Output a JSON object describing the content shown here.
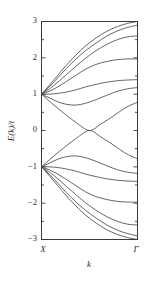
{
  "chart_data": {
    "type": "line",
    "title": "",
    "xlabel": "k",
    "ylabel": "E(k)/t",
    "xlim": [
      0,
      1
    ],
    "ylim": [
      -3,
      3
    ],
    "grid": false,
    "legend": null,
    "x_tick_labels": [
      "X",
      "Γ"
    ],
    "x_tick_positions": [
      0,
      1
    ],
    "y_tick_labels": [
      "3",
      "2",
      "1",
      "0",
      "-1",
      "-2",
      "-3"
    ],
    "y_tick_values": [
      3,
      2,
      1,
      0,
      -1,
      -2,
      -3
    ],
    "y_minor_ticks": [
      2.5,
      1.5,
      0.5,
      -0.5,
      -1.5,
      -2.5
    ],
    "x_axis_endpoint_left": "X",
    "x_axis_endpoint_right": "Γ",
    "degeneracy_points": [
      {
        "x": 0,
        "y": 1,
        "label": "X-point upper degeneracy"
      },
      {
        "x": 0,
        "y": -1,
        "label": "X-point lower degeneracy"
      }
    ],
    "series": [
      {
        "name": "upper-band-1",
        "x": [
          0,
          0.08,
          0.17,
          0.26,
          0.36,
          0.46,
          0.57,
          0.68,
          0.79,
          0.9,
          1.0
        ],
        "y": [
          1.0,
          1.24,
          1.52,
          1.8,
          2.08,
          2.33,
          2.55,
          2.73,
          2.86,
          2.95,
          3.0
        ]
      },
      {
        "name": "upper-band-2",
        "x": [
          0,
          0.08,
          0.17,
          0.26,
          0.36,
          0.46,
          0.57,
          0.68,
          0.79,
          0.9,
          1.0
        ],
        "y": [
          1.0,
          1.2,
          1.45,
          1.71,
          1.97,
          2.2,
          2.41,
          2.6,
          2.74,
          2.84,
          2.9
        ]
      },
      {
        "name": "upper-band-3",
        "x": [
          0,
          0.08,
          0.17,
          0.26,
          0.36,
          0.46,
          0.57,
          0.68,
          0.79,
          0.9,
          1.0
        ],
        "y": [
          1.0,
          1.14,
          1.33,
          1.54,
          1.77,
          1.99,
          2.2,
          2.37,
          2.5,
          2.58,
          2.6
        ]
      },
      {
        "name": "upper-band-4",
        "x": [
          0,
          0.08,
          0.17,
          0.26,
          0.36,
          0.46,
          0.57,
          0.68,
          0.79,
          0.9,
          1.0
        ],
        "y": [
          1.0,
          1.08,
          1.2,
          1.35,
          1.52,
          1.69,
          1.82,
          1.9,
          1.95,
          1.97,
          1.97
        ]
      },
      {
        "name": "upper-band-5",
        "x": [
          0,
          0.08,
          0.17,
          0.26,
          0.36,
          0.46,
          0.57,
          0.68,
          0.79,
          0.9,
          1.0
        ],
        "y": [
          1.0,
          1.0,
          1.02,
          1.06,
          1.12,
          1.2,
          1.27,
          1.33,
          1.37,
          1.39,
          1.4
        ]
      },
      {
        "name": "upper-band-6",
        "x": [
          0,
          0.08,
          0.17,
          0.26,
          0.36,
          0.46,
          0.57,
          0.68,
          0.79,
          0.9,
          1.0
        ],
        "y": [
          1.0,
          0.9,
          0.79,
          0.72,
          0.7,
          0.75,
          0.85,
          0.97,
          1.08,
          1.15,
          1.18
        ]
      },
      {
        "name": "dispersive-band-upper",
        "x": [
          0,
          0.12,
          0.25,
          0.37,
          0.5,
          0.62,
          0.75,
          0.87,
          1.0
        ],
        "y": [
          1.0,
          0.72,
          0.44,
          0.2,
          0.0,
          0.18,
          0.4,
          0.62,
          0.78
        ]
      },
      {
        "name": "dispersive-band-lower",
        "x": [
          0,
          0.12,
          0.25,
          0.37,
          0.5,
          0.62,
          0.75,
          0.87,
          1.0
        ],
        "y": [
          -1.0,
          -0.72,
          -0.44,
          -0.2,
          0.0,
          -0.18,
          -0.4,
          -0.62,
          -0.78
        ]
      },
      {
        "name": "lower-band-6",
        "x": [
          0,
          0.08,
          0.17,
          0.26,
          0.36,
          0.46,
          0.57,
          0.68,
          0.79,
          0.9,
          1.0
        ],
        "y": [
          -1.0,
          -0.9,
          -0.79,
          -0.72,
          -0.7,
          -0.75,
          -0.85,
          -0.97,
          -1.08,
          -1.15,
          -1.18
        ]
      },
      {
        "name": "lower-band-5",
        "x": [
          0,
          0.08,
          0.17,
          0.26,
          0.36,
          0.46,
          0.57,
          0.68,
          0.79,
          0.9,
          1.0
        ],
        "y": [
          -1.0,
          -1.0,
          -1.02,
          -1.06,
          -1.12,
          -1.2,
          -1.27,
          -1.33,
          -1.37,
          -1.39,
          -1.4
        ]
      },
      {
        "name": "lower-band-4",
        "x": [
          0,
          0.08,
          0.17,
          0.26,
          0.36,
          0.46,
          0.57,
          0.68,
          0.79,
          0.9,
          1.0
        ],
        "y": [
          -1.0,
          -1.08,
          -1.2,
          -1.35,
          -1.52,
          -1.69,
          -1.82,
          -1.9,
          -1.95,
          -1.97,
          -1.97
        ]
      },
      {
        "name": "lower-band-3",
        "x": [
          0,
          0.08,
          0.17,
          0.26,
          0.36,
          0.46,
          0.57,
          0.68,
          0.79,
          0.9,
          1.0
        ],
        "y": [
          -1.0,
          -1.14,
          -1.33,
          -1.54,
          -1.77,
          -1.99,
          -2.2,
          -2.37,
          -2.5,
          -2.58,
          -2.6
        ]
      },
      {
        "name": "lower-band-2",
        "x": [
          0,
          0.08,
          0.17,
          0.26,
          0.36,
          0.46,
          0.57,
          0.68,
          0.79,
          0.9,
          1.0
        ],
        "y": [
          -1.0,
          -1.2,
          -1.45,
          -1.71,
          -1.97,
          -2.2,
          -2.41,
          -2.6,
          -2.74,
          -2.84,
          -2.9
        ]
      },
      {
        "name": "lower-band-1",
        "x": [
          0,
          0.08,
          0.17,
          0.26,
          0.36,
          0.46,
          0.57,
          0.68,
          0.79,
          0.9,
          1.0
        ],
        "y": [
          -1.0,
          -1.24,
          -1.52,
          -1.8,
          -2.08,
          -2.33,
          -2.55,
          -2.73,
          -2.86,
          -2.95,
          -3.0
        ]
      }
    ]
  },
  "axis": {
    "y_label": "E(k)/t",
    "x_label": "k",
    "left_point": "X",
    "right_point": "Γ"
  },
  "colors": {
    "curve": "#4a4a4a",
    "frame": "#3a3a3a",
    "text": "#2b2b2b",
    "background": "#ffffff"
  }
}
